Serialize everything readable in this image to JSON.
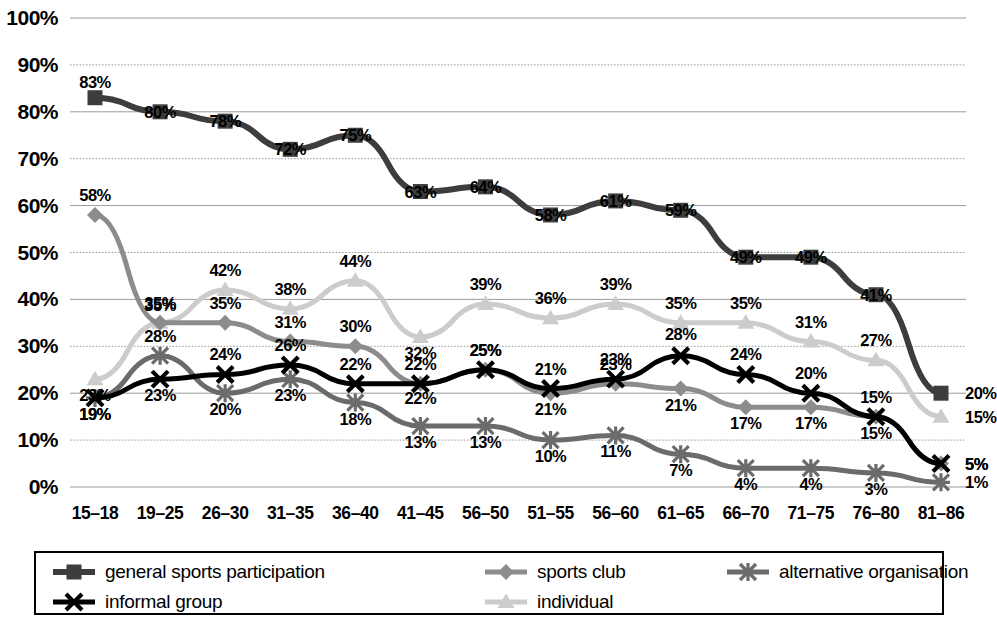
{
  "chart_data": {
    "type": "line",
    "title": "",
    "subtitle": "",
    "xlabel": "",
    "ylabel": "",
    "ylim": [
      0,
      100
    ],
    "ytick_labels": [
      "0%",
      "10%",
      "20%",
      "30%",
      "40%",
      "50%",
      "60%",
      "70%",
      "80%",
      "90%",
      "100%"
    ],
    "ytick_values": [
      0,
      10,
      20,
      30,
      40,
      50,
      60,
      70,
      80,
      90,
      100
    ],
    "grid": true,
    "grid_axis": "y",
    "legend_position": "bottom",
    "value_suffix": "%",
    "categories": [
      "15–18",
      "19–25",
      "26–30",
      "31–35",
      "36–40",
      "41–45",
      "56–50",
      "51–55",
      "56–60",
      "61–65",
      "66–70",
      "71–75",
      "76–80",
      "81–86"
    ],
    "series": [
      {
        "name": "general sports participation",
        "color": "#3d3d3d",
        "marker": "square",
        "width": 6,
        "values": [
          83,
          80,
          78,
          72,
          75,
          63,
          64,
          58,
          61,
          59,
          49,
          49,
          41,
          20
        ],
        "labels": [
          "83%",
          "80%",
          "78%",
          "72%",
          "75%",
          "63%",
          "64%",
          "58%",
          "61%",
          "59%",
          "49%",
          "49%",
          "41%",
          "20%"
        ]
      },
      {
        "name": "sports club",
        "color": "#8c8c8c",
        "marker": "diamond",
        "width": 5,
        "values": [
          58,
          35,
          35,
          31,
          30,
          22,
          25,
          20,
          22,
          21,
          17,
          17,
          15,
          5
        ],
        "labels": [
          "58%",
          "35%",
          "35%",
          "31%",
          "30%",
          "22%",
          "25%",
          "21%",
          "23%",
          "21%",
          "17%",
          "17%",
          "15%",
          "5%"
        ]
      },
      {
        "name": "alternative organisation",
        "color": "#6b6b6b",
        "marker": "asterisk",
        "width": 5,
        "values": [
          19,
          28,
          20,
          23,
          18,
          13,
          13,
          10,
          11,
          7,
          4,
          4,
          3,
          1
        ],
        "labels": [
          "19%",
          "28%",
          "20%",
          "23%",
          "18%",
          "13%",
          "13%",
          "10%",
          "11%",
          "7%",
          "4%",
          "4%",
          "3%",
          "1%"
        ]
      },
      {
        "name": "informal group",
        "color": "#000000",
        "marker": "cross",
        "width": 5,
        "values": [
          19,
          23,
          24,
          26,
          22,
          22,
          25,
          21,
          23,
          28,
          24,
          20,
          15,
          5
        ],
        "labels": [
          "19%",
          "23%",
          "24%",
          "26%",
          "22%",
          "22%",
          "25%",
          "21%",
          "23%",
          "28%",
          "24%",
          "20%",
          "15%",
          "5%"
        ]
      },
      {
        "name": "individual",
        "color": "#cccccc",
        "marker": "triangle",
        "width": 5,
        "values": [
          23,
          35,
          42,
          38,
          44,
          32,
          39,
          36,
          39,
          35,
          35,
          31,
          27,
          15
        ],
        "labels": [
          "23%",
          "35%",
          "42%",
          "38%",
          "44%",
          "32%",
          "39%",
          "36%",
          "39%",
          "35%",
          "35%",
          "31%",
          "27%",
          "15%"
        ]
      }
    ]
  },
  "legend": {
    "items": [
      {
        "label": "general sports participation",
        "series": 0
      },
      {
        "label": "sports club",
        "series": 1
      },
      {
        "label": "alternative organisation",
        "series": 2
      },
      {
        "label": "informal group",
        "series": 3
      },
      {
        "label": "individual",
        "series": 4
      }
    ]
  },
  "annotations": {
    "label_offsets": [
      [
        -16,
        0,
        0,
        0,
        0,
        0,
        0,
        0,
        0,
        0,
        0,
        0,
        0,
        0
      ],
      [
        -20,
        -18,
        -20,
        -20,
        -20,
        14,
        -20,
        16,
        -20,
        16,
        16,
        16,
        16,
        0
      ],
      [
        16,
        -20,
        16,
        16,
        16,
        16,
        16,
        16,
        16,
        16,
        16,
        16,
        16,
        0
      ],
      [
        16,
        16,
        -20,
        -20,
        -20,
        -20,
        -20,
        -20,
        -20,
        -22,
        -20,
        -20,
        -20,
        0
      ],
      [
        16,
        -20,
        -20,
        -20,
        -20,
        16,
        -20,
        -20,
        -20,
        -20,
        -20,
        -20,
        -20,
        0
      ]
    ]
  }
}
